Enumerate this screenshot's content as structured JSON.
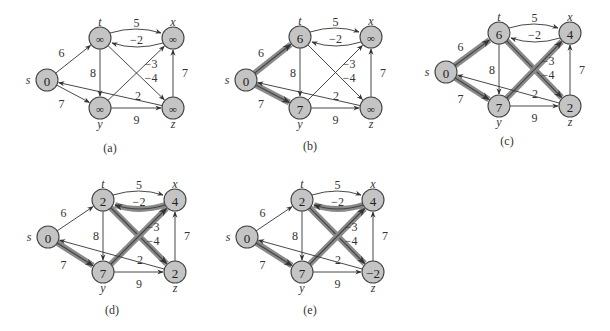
{
  "figure": {
    "nodes": [
      "s",
      "t",
      "x",
      "y",
      "z"
    ],
    "edges": [
      {
        "from": "s",
        "to": "t",
        "w": "6"
      },
      {
        "from": "s",
        "to": "y",
        "w": "7"
      },
      {
        "from": "t",
        "to": "x",
        "w": "5"
      },
      {
        "from": "x",
        "to": "t",
        "w": "−2"
      },
      {
        "from": "t",
        "to": "y",
        "w": "8"
      },
      {
        "from": "t",
        "to": "z",
        "w": "−4"
      },
      {
        "from": "y",
        "to": "x",
        "w": "−3"
      },
      {
        "from": "y",
        "to": "z",
        "w": "9"
      },
      {
        "from": "z",
        "to": "x",
        "w": "7"
      },
      {
        "from": "z",
        "to": "s",
        "w": "2"
      }
    ],
    "panels": [
      {
        "caption": "(a)",
        "values": {
          "s": "0",
          "t": "∞",
          "x": "∞",
          "y": "∞",
          "z": "∞"
        },
        "highlighted": []
      },
      {
        "caption": "(b)",
        "values": {
          "s": "0",
          "t": "6",
          "x": "∞",
          "y": "7",
          "z": "∞"
        },
        "highlighted": [
          "s-t",
          "s-y"
        ]
      },
      {
        "caption": "(c)",
        "values": {
          "s": "0",
          "t": "6",
          "x": "4",
          "y": "7",
          "z": "2"
        },
        "highlighted": [
          "s-t",
          "s-y",
          "y-x",
          "t-z"
        ]
      },
      {
        "caption": "(d)",
        "values": {
          "s": "0",
          "t": "2",
          "x": "4",
          "y": "7",
          "z": "2"
        },
        "highlighted": [
          "s-y",
          "y-x",
          "x-t",
          "t-z"
        ]
      },
      {
        "caption": "(e)",
        "values": {
          "s": "0",
          "t": "2",
          "x": "4",
          "y": "7",
          "z": "−2"
        },
        "highlighted": [
          "s-y",
          "y-x",
          "x-t",
          "t-z"
        ]
      }
    ]
  },
  "colors": {
    "node_fill": "#c4c4c4",
    "highlight_edge": "#8a8a8a",
    "edge": "#333333",
    "background": "#ffffff"
  }
}
